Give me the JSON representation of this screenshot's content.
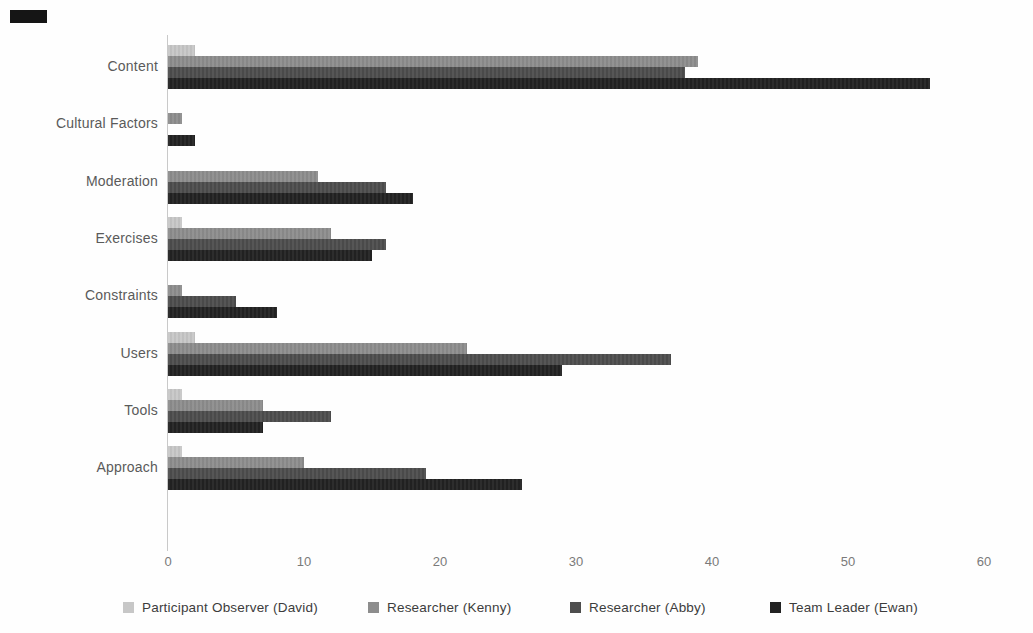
{
  "chart_data": {
    "type": "bar",
    "orientation": "horizontal",
    "title": "",
    "categories": [
      "Content",
      "Cultural Factors",
      "Moderation",
      "Exercises",
      "Constraints",
      "Users",
      "Tools",
      "Approach"
    ],
    "series": [
      {
        "name": "Participant Observer (David)",
        "color": "#c7c7c7",
        "values": [
          2,
          0,
          0,
          1,
          0,
          2,
          1,
          1
        ]
      },
      {
        "name": "Researcher (Kenny)",
        "color": "#8d8d8d",
        "values": [
          39,
          1,
          11,
          12,
          1,
          22,
          7,
          10
        ]
      },
      {
        "name": "Researcher (Abby)",
        "color": "#4d4d4d",
        "values": [
          38,
          0,
          16,
          16,
          5,
          37,
          12,
          19
        ]
      },
      {
        "name": "Team Leader (Ewan)",
        "color": "#222222",
        "values": [
          56,
          2,
          18,
          15,
          8,
          29,
          7,
          26
        ]
      }
    ],
    "x_axis": {
      "min": 0,
      "max": 60,
      "tick_labels": [
        "0",
        "10",
        "20",
        "30",
        "40",
        "50",
        "60"
      ],
      "ticks": [
        0,
        10,
        20,
        30,
        40,
        50,
        60
      ]
    },
    "ylabel": "",
    "xlabel": "",
    "grid": false,
    "legend_position": "bottom"
  },
  "colors": {
    "background": "#fefefe",
    "axis_line": "#c9c9c9",
    "tick_text": "#7a7a7a",
    "category_text": "#5a5a5a",
    "legend_text": "#3c3c3c",
    "scan_artifact": "#151515"
  }
}
